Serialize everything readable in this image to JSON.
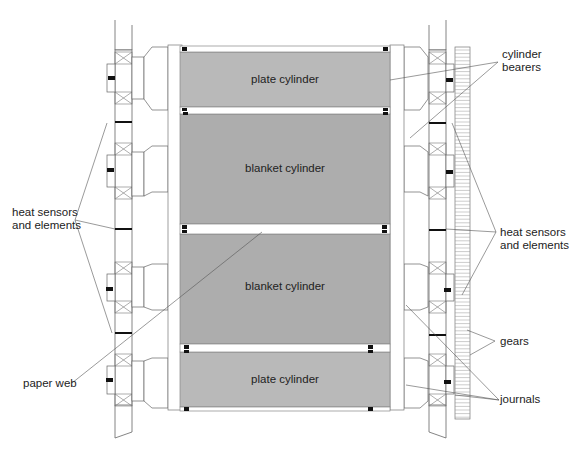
{
  "diagram": {
    "type": "printing press cylinder arrangement (cross-section)",
    "cylinders": [
      {
        "label": "plate cylinder",
        "position": "top"
      },
      {
        "label": "blanket cylinder",
        "position": "upper-middle"
      },
      {
        "label": "blanket cylinder",
        "position": "lower-middle"
      },
      {
        "label": "plate cylinder",
        "position": "bottom"
      }
    ],
    "callouts": {
      "cylinder_bearers": [
        "cylinder",
        "bearers"
      ],
      "heat_left": [
        "heat sensors",
        "and elements"
      ],
      "heat_right": [
        "heat sensors",
        "and elements"
      ],
      "gears": "gears",
      "paper_web": "paper web",
      "journals": "journals"
    },
    "colors": {
      "cylinder_fill": "#b4b4b4",
      "line": "#555555",
      "marker": "#111111"
    }
  }
}
